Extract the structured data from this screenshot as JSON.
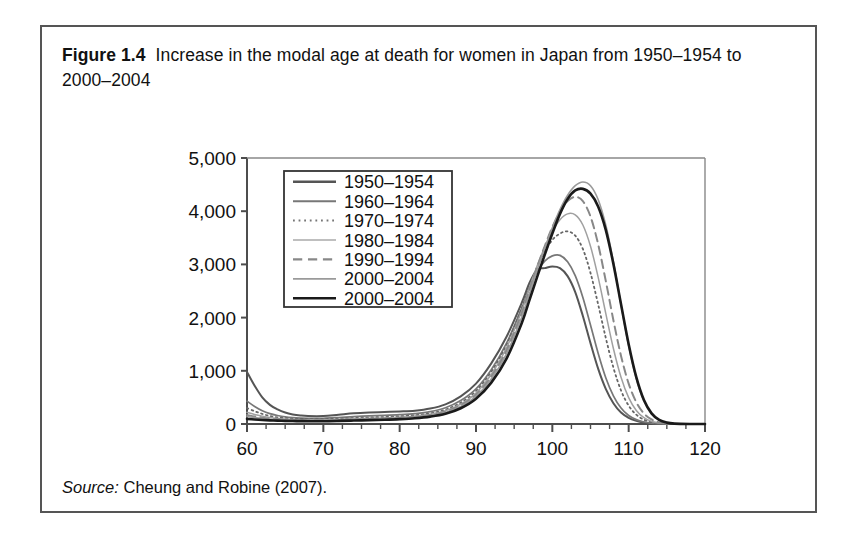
{
  "figure": {
    "label": "Figure 1.4",
    "caption": "Increase in the modal age at death for women in Japan from 1950–1954 to 2000–2004",
    "source_label": "Source:",
    "source_text": "Cheung and Robine (2007)."
  },
  "chart_data": {
    "type": "line",
    "title": "Increase in the modal age at death for women in Japan from 1950–1954 to 2000–2004",
    "xlabel": "Age (years)",
    "ylabel": "",
    "xlim": [
      60,
      120
    ],
    "ylim": [
      0,
      5000
    ],
    "xticks": [
      60,
      70,
      80,
      90,
      100,
      110,
      120
    ],
    "xticklabels": [
      "60",
      "70",
      "80",
      "90",
      "100",
      "110",
      "120"
    ],
    "yticks": [
      0,
      1000,
      2000,
      3000,
      4000,
      5000
    ],
    "yticklabels": [
      "0",
      "1,000",
      "2,000",
      "3,000",
      "4,000",
      "5,000"
    ],
    "grid": false,
    "legend_position": "top-left-inside",
    "x": [
      60,
      61,
      62,
      63,
      64,
      65,
      66,
      67,
      68,
      70,
      72,
      74,
      76,
      78,
      80,
      82,
      84,
      86,
      88,
      90,
      92,
      94,
      96,
      97,
      98,
      99,
      100,
      101,
      102,
      103,
      104,
      105,
      106,
      107,
      108,
      109,
      110,
      111,
      112,
      113,
      114,
      115,
      116,
      118,
      120
    ],
    "series": [
      {
        "name": "1950–1954",
        "label": "1950–1954",
        "style": "solid",
        "color": "#555555",
        "width": 2.0,
        "peak_age": 98,
        "peak_value": 2990,
        "values": [
          980,
          720,
          500,
          360,
          275,
          215,
          180,
          160,
          150,
          150,
          175,
          200,
          215,
          225,
          235,
          250,
          290,
          370,
          520,
          760,
          1140,
          1640,
          2280,
          2650,
          2900,
          2930,
          2960,
          2930,
          2780,
          2480,
          2030,
          1520,
          1040,
          660,
          390,
          215,
          115,
          60,
          28,
          12,
          5,
          2,
          0,
          0,
          0
        ]
      },
      {
        "name": "1960–1964",
        "label": "1960–1964",
        "style": "solid",
        "color": "#777777",
        "width": 1.7,
        "peak_age": 99,
        "peak_value": 3180,
        "values": [
          430,
          330,
          250,
          195,
          160,
          135,
          120,
          112,
          108,
          108,
          122,
          140,
          152,
          162,
          175,
          195,
          232,
          305,
          440,
          660,
          1020,
          1520,
          2180,
          2560,
          2860,
          3060,
          3160,
          3170,
          3050,
          2790,
          2380,
          1860,
          1330,
          870,
          530,
          300,
          160,
          82,
          38,
          16,
          6,
          2,
          0,
          0,
          0
        ]
      },
      {
        "name": "1970–1974",
        "label": "1970–1974",
        "style": "dotted",
        "color": "#666666",
        "width": 1.8,
        "peak_age": 101,
        "peak_value": 3620,
        "values": [
          300,
          240,
          190,
          150,
          125,
          110,
          100,
          95,
          92,
          92,
          100,
          112,
          122,
          132,
          145,
          165,
          200,
          270,
          400,
          620,
          980,
          1490,
          2180,
          2580,
          2950,
          3240,
          3460,
          3580,
          3620,
          3540,
          3290,
          2840,
          2250,
          1620,
          1060,
          630,
          345,
          175,
          82,
          35,
          13,
          4,
          0,
          0,
          0
        ]
      },
      {
        "name": "1980–1984",
        "label": "1980–1984",
        "style": "solid",
        "color": "#a0a0a0",
        "width": 1.5,
        "peak_age": 102,
        "peak_value": 3960,
        "values": [
          220,
          180,
          148,
          122,
          104,
          93,
          86,
          82,
          80,
          80,
          87,
          97,
          106,
          115,
          128,
          148,
          182,
          248,
          372,
          580,
          930,
          1430,
          2130,
          2560,
          2970,
          3320,
          3620,
          3840,
          3950,
          3930,
          3740,
          3340,
          2760,
          2080,
          1420,
          880,
          495,
          255,
          120,
          50,
          18,
          6,
          0,
          0,
          0
        ]
      },
      {
        "name": "1990–1994",
        "label": "1990–1994",
        "style": "dashed",
        "color": "#888888",
        "width": 2.0,
        "peak_age": 103,
        "peak_value": 4280,
        "values": [
          170,
          142,
          120,
          102,
          89,
          80,
          75,
          72,
          70,
          70,
          76,
          85,
          94,
          103,
          116,
          136,
          170,
          234,
          352,
          552,
          890,
          1380,
          2080,
          2520,
          2950,
          3340,
          3700,
          3990,
          4190,
          4270,
          4190,
          3900,
          3380,
          2690,
          1950,
          1280,
          760,
          410,
          198,
          86,
          32,
          10,
          0,
          0,
          0
        ]
      },
      {
        "name": "2000–2004",
        "label": "2000–2004",
        "style": "solid",
        "color": "#9a9a9a",
        "width": 1.6,
        "peak_age": 104,
        "peak_value": 4550,
        "values": [
          140,
          120,
          103,
          90,
          80,
          73,
          68,
          65,
          64,
          64,
          70,
          78,
          86,
          95,
          107,
          126,
          158,
          218,
          330,
          522,
          845,
          1320,
          2010,
          2450,
          2890,
          3300,
          3690,
          4030,
          4300,
          4480,
          4550,
          4480,
          4220,
          3740,
          3050,
          2240,
          1470,
          850,
          430,
          190,
          72,
          24,
          6,
          0,
          0
        ]
      },
      {
        "name": "2000–2004-bold",
        "label": "2000–2004",
        "style": "solid",
        "color": "#1a1a1a",
        "width": 2.6,
        "peak_age": 105,
        "peak_value": 4420,
        "values": [
          95,
          85,
          76,
          69,
          63,
          59,
          56,
          54,
          53,
          53,
          58,
          65,
          72,
          80,
          91,
          108,
          138,
          192,
          296,
          474,
          778,
          1230,
          1900,
          2330,
          2760,
          3180,
          3580,
          3950,
          4230,
          4390,
          4420,
          4330,
          4090,
          3650,
          3010,
          2250,
          1500,
          880,
          450,
          200,
          78,
          26,
          7,
          0,
          0
        ]
      }
    ],
    "legend_entries": [
      {
        "label": "1950–1954",
        "style": "solid",
        "color": "#555555",
        "width": 2.4
      },
      {
        "label": "1960–1964",
        "style": "solid",
        "color": "#777777",
        "width": 2.0
      },
      {
        "label": "1970–1974",
        "style": "dotted",
        "color": "#777777",
        "width": 2.0
      },
      {
        "label": "1980–1984",
        "style": "solid",
        "color": "#aaaaaa",
        "width": 1.6
      },
      {
        "label": "1990–1994",
        "style": "dashed",
        "color": "#888888",
        "width": 2.2
      },
      {
        "label": "2000–2004",
        "style": "solid",
        "color": "#9a9a9a",
        "width": 1.8
      },
      {
        "label": "2000–2004",
        "style": "solid",
        "color": "#1a1a1a",
        "width": 2.6
      }
    ]
  }
}
